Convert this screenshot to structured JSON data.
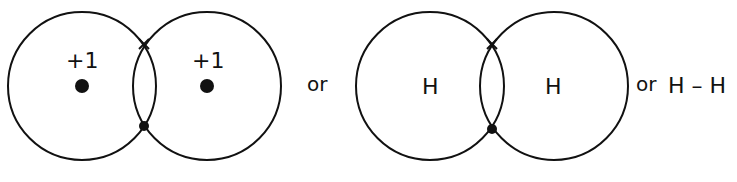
{
  "diagram": {
    "panel1": {
      "left_label": "+1",
      "right_label": "+1"
    },
    "or1": "or",
    "panel2": {
      "left_label": "H",
      "right_label": "H"
    },
    "or2": "or",
    "formula": "H – H"
  }
}
